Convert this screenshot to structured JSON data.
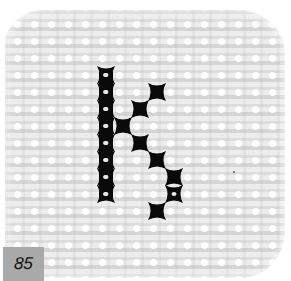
{
  "figure": {
    "letter_depicted": "K",
    "badge": {
      "label": "85",
      "background": "#a9a9a9",
      "text_color": "#111111"
    },
    "fabric": {
      "color": "#ededed",
      "grid_pitch_px": 17
    },
    "stitch_color": "#0a0a0a",
    "stitch_grid": {
      "origin_x": 106,
      "origin_y": 75,
      "pitch": 17,
      "cells": [
        {
          "col": 0,
          "row": 0
        },
        {
          "col": 0,
          "row": 1
        },
        {
          "col": 0,
          "row": 2
        },
        {
          "col": 0,
          "row": 3
        },
        {
          "col": 0,
          "row": 4
        },
        {
          "col": 0,
          "row": 5
        },
        {
          "col": 0,
          "row": 6
        },
        {
          "col": 0,
          "row": 7
        },
        {
          "col": 3,
          "row": 1
        },
        {
          "col": 2,
          "row": 2
        },
        {
          "col": 1,
          "row": 3
        },
        {
          "col": 2,
          "row": 4
        },
        {
          "col": 3,
          "row": 5
        },
        {
          "col": 4,
          "row": 6
        },
        {
          "col": 4,
          "row": 7
        },
        {
          "col": 3,
          "row": 8
        }
      ]
    }
  }
}
